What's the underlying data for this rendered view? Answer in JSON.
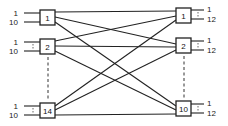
{
  "diagram": {
    "left_stages": [
      {
        "id": "1",
        "label": "1",
        "inputs": [
          "1",
          "10"
        ],
        "x": 40,
        "y": 10
      },
      {
        "id": "2",
        "label": "2",
        "inputs": [
          "1",
          "10"
        ],
        "x": 40,
        "y": 39
      },
      {
        "id": "14",
        "label": "14",
        "inputs": [
          "1",
          "10"
        ],
        "x": 40,
        "y": 103
      }
    ],
    "right_stages": [
      {
        "id": "1",
        "label": "1",
        "outputs": [
          "1",
          "12"
        ],
        "x": 176,
        "y": 8
      },
      {
        "id": "2",
        "label": "2",
        "outputs": [
          "1",
          "12"
        ],
        "x": 176,
        "y": 38
      },
      {
        "id": "10",
        "label": "10",
        "outputs": [
          "1",
          "12"
        ],
        "x": 176,
        "y": 101
      }
    ]
  }
}
